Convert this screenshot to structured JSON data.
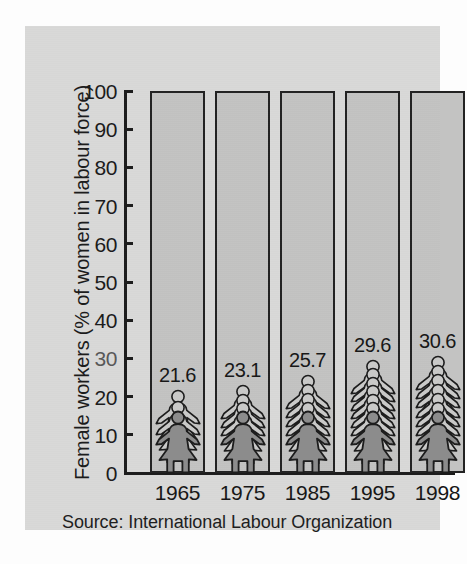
{
  "chart_data": {
    "type": "bar",
    "title": "",
    "subtitle": "",
    "xlabel": "",
    "ylabel": "Female workers (% of women in labour force)",
    "categories": [
      "1965",
      "1975",
      "1985",
      "1995",
      "1998"
    ],
    "values": [
      21.6,
      23.1,
      25.7,
      29.6,
      30.6
    ],
    "value_labels": [
      "21.6",
      "23.1",
      "25.7",
      "29.6",
      "30.6"
    ],
    "bar_heights": [
      100,
      100,
      100,
      100,
      100
    ],
    "bar_note": "Each bar is drawn to 100%; the stacked female pictogram inside indicates the value.",
    "ylim": [
      0,
      100
    ],
    "ytick_labels": [
      "0",
      "10",
      "20",
      "30",
      "40",
      "50",
      "60",
      "70",
      "80",
      "90",
      "100"
    ],
    "ytick_values": [
      0,
      10,
      20,
      30,
      40,
      50,
      60,
      70,
      80,
      90,
      100
    ],
    "grid": false,
    "legend": null,
    "series": [
      {
        "name": "Female workers (% of women in labour force)",
        "values": [
          21.6,
          23.1,
          25.7,
          29.6,
          30.6
        ]
      }
    ],
    "annotations": [
      "Source: International Labour Organization"
    ]
  },
  "axis": {
    "y_title": "Female workers (% of women in labour force)",
    "ticks": [
      {
        "label": "100",
        "value": 100,
        "degraded": false
      },
      {
        "label": "90",
        "value": 90,
        "degraded": false
      },
      {
        "label": "80",
        "value": 80,
        "degraded": false
      },
      {
        "label": "70",
        "value": 70,
        "degraded": false
      },
      {
        "label": "60",
        "value": 60,
        "degraded": false
      },
      {
        "label": "50",
        "value": 50,
        "degraded": false
      },
      {
        "label": "40",
        "value": 40,
        "degraded": false
      },
      {
        "label": "30",
        "value": 30,
        "degraded": true
      },
      {
        "label": "20",
        "value": 20,
        "degraded": false
      },
      {
        "label": "10",
        "value": 10,
        "degraded": false
      },
      {
        "label": "0",
        "value": 0,
        "degraded": false
      }
    ]
  },
  "bars": [
    {
      "year": "1965",
      "value": 21.6,
      "value_label": "21.6",
      "figures": 3
    },
    {
      "year": "1975",
      "value": 23.1,
      "value_label": "23.1",
      "figures": 4
    },
    {
      "year": "1985",
      "value": 25.7,
      "value_label": "25.7",
      "figures": 5
    },
    {
      "year": "1995",
      "value": 29.6,
      "value_label": "29.6",
      "figures": 7
    },
    {
      "year": "1998",
      "value": 30.6,
      "value_label": "30.6",
      "figures": 7
    }
  ],
  "source": {
    "text": "Source: International Labour Organization"
  },
  "colors": {
    "panel_background": "#d9d9d8",
    "bar_fill": "#c3c3c2",
    "bar_outline": "#222222",
    "figure_fill_dark": "#8c8c8c",
    "figure_fill_light": "#c9c9c8",
    "figure_outline": "#1d1d1d",
    "text": "#1b1b1b",
    "page_background": "#ffffff"
  }
}
